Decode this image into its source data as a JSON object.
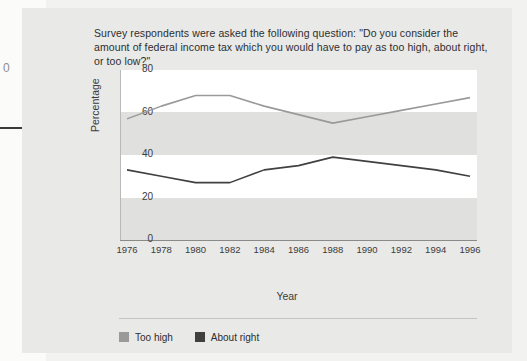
{
  "figure": {
    "title": "Survey respondents were asked the following question: \"Do you consider the amount of federal income tax which you would have to pay as too high, about right, or too low?\"",
    "year_axis_title": "Year",
    "percentage_axis_title": "Percentage"
  },
  "edge_artifacts": {
    "margin_glyph": "0"
  },
  "colors": {
    "too_high_line": "#9a9a98",
    "about_right_line": "#404040",
    "page_background": "#e9e9e7",
    "band_light": "#ffffff",
    "band_gray": "#e0e0de",
    "axis": "#8a8a88",
    "text": "#2e2e2e"
  },
  "legend": {
    "items": [
      {
        "label": "Too high",
        "color": "#9a9a98"
      },
      {
        "label": "About right",
        "color": "#404040"
      }
    ]
  },
  "chart_data": {
    "type": "line",
    "title": "Survey respondents were asked the following question: \"Do you consider the amount of federal income tax which you would have to pay as too high, about right, or too low?\"",
    "xlabel": "Year",
    "ylabel": "Percentage",
    "x": [
      1976,
      1978,
      1980,
      1982,
      1984,
      1986,
      1988,
      1990,
      1992,
      1994,
      1996
    ],
    "xticklabels": [
      "1976",
      "1978",
      "1980",
      "1982",
      "1984",
      "1986",
      "1988",
      "1990",
      "1992",
      "1994",
      "1996"
    ],
    "yticklabels": [
      "0",
      "20",
      "40",
      "60",
      "80"
    ],
    "yticks": [
      0,
      20,
      40,
      60,
      80
    ],
    "ylim": [
      0,
      80
    ],
    "xlim": [
      1976,
      1996
    ],
    "grid": false,
    "banded_background": true,
    "legend_position": "bottom-left",
    "series": [
      {
        "name": "Too high",
        "color": "#9a9a98",
        "values": [
          57,
          63,
          68,
          68,
          63,
          59,
          55,
          58,
          61,
          64,
          67
        ]
      },
      {
        "name": "About right",
        "color": "#404040",
        "values": [
          33,
          30,
          27,
          27,
          33,
          35,
          39,
          37,
          35,
          33,
          30
        ]
      }
    ]
  }
}
